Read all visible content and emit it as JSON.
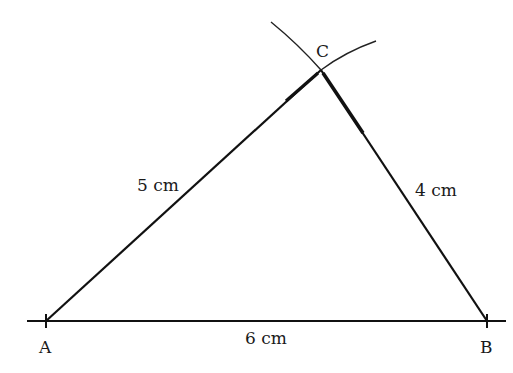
{
  "diagram": {
    "vertices": [
      {
        "name": "A",
        "x": 47,
        "y": 321
      },
      {
        "name": "B",
        "x": 487,
        "y": 321
      },
      {
        "name": "C",
        "x": 321,
        "y": 70
      }
    ],
    "sides": [
      {
        "from": "A",
        "to": "B",
        "label": "6 cm"
      },
      {
        "from": "A",
        "to": "C",
        "label": "5 cm"
      },
      {
        "from": "C",
        "to": "B",
        "label": "4 cm"
      }
    ],
    "labels": {
      "A": "A",
      "B": "B",
      "C": "C",
      "AB": "6 cm",
      "AC": "5 cm",
      "CB": "4 cm"
    },
    "construction_arcs": [
      {
        "center": "A",
        "radius_label": "5 cm"
      },
      {
        "center": "B",
        "radius_label": "4 cm"
      }
    ],
    "colors": {
      "line": "#111111",
      "text": "#1a1a1a",
      "background": "#ffffff"
    }
  }
}
